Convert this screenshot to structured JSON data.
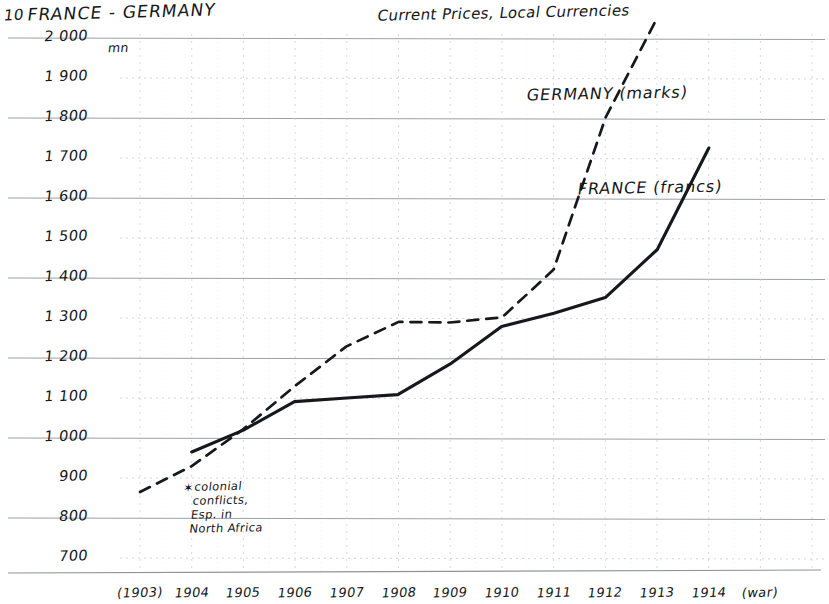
{
  "page": {
    "number": "10",
    "width": 829,
    "height": 604,
    "paper_color": "#ffffff",
    "ink_color": "#15181c",
    "grid_major_color": "#9aa0a6",
    "grid_minor_color": "#c8ccd2"
  },
  "header": {
    "title": "FRANCE - GERMANY",
    "subtitle": "Current Prices, Local Currencies"
  },
  "annotation": {
    "marker": "✶",
    "lines": [
      "colonial",
      "conflicts,",
      "Esp. in",
      "North Africa"
    ]
  },
  "series_labels": {
    "germany": "GERMANY (marks)",
    "france": "FRANCE (francs)"
  },
  "axis": {
    "y_unit": "mn",
    "y_ticks": [
      "2000",
      "1900",
      "1800",
      "1700",
      "1600",
      "1500",
      "1400",
      "1300",
      "1200",
      "1100",
      "1000",
      "900",
      "800",
      "700"
    ],
    "x_ticks": [
      "(1903)",
      "1904",
      "1905",
      "1906",
      "1907",
      "1908",
      "1909",
      "1910",
      "1911",
      "1912",
      "1913",
      "1914",
      "(war)"
    ]
  },
  "chart_data": {
    "type": "line",
    "title": "FRANCE - GERMANY",
    "subtitle": "Current Prices, Local Currencies",
    "xlabel": "",
    "ylabel": "mn",
    "ylim": [
      650,
      2050
    ],
    "xlim": [
      "1903",
      "war"
    ],
    "grid": true,
    "grid_major_step": 200,
    "grid_minor_step": 100,
    "legend_position": "inline-right",
    "x": [
      "(1903)",
      "1904",
      "1905",
      "1906",
      "1907",
      "1908",
      "1909",
      "1910",
      "1911",
      "1912",
      "1913",
      "1914",
      "(war)"
    ],
    "categories": [
      "1903",
      "1904",
      "1905",
      "1906",
      "1907",
      "1908",
      "1909",
      "1910",
      "1911",
      "1912",
      "1913",
      "1914"
    ],
    "series": [
      {
        "name": "FRANCE (francs)",
        "unit": "francs",
        "style": "solid",
        "color": "#15181c",
        "x": [
          "1904",
          "1905",
          "1906",
          "1907",
          "1908",
          "1909",
          "1910",
          "1911",
          "1912",
          "1913",
          "1914"
        ],
        "values": [
          965,
          1020,
          1090,
          1100,
          1110,
          1185,
          1280,
          1310,
          1350,
          1470,
          1725
        ]
      },
      {
        "name": "GERMANY (marks)",
        "unit": "marks",
        "style": "dashed",
        "color": "#15181c",
        "x": [
          "1903",
          "1904",
          "1905",
          "1906",
          "1907",
          "1908",
          "1909",
          "1910",
          "1911",
          "1912",
          "1913"
        ],
        "values": [
          865,
          930,
          1020,
          1130,
          1230,
          1290,
          1290,
          1300,
          1420,
          1800,
          2050
        ]
      }
    ],
    "annotations": [
      {
        "text": "✶ colonial conflicts, Esp. in North Africa",
        "near_x": "1904",
        "near_y": 820
      },
      {
        "text": "(war)",
        "near_x": "after 1914"
      }
    ]
  }
}
